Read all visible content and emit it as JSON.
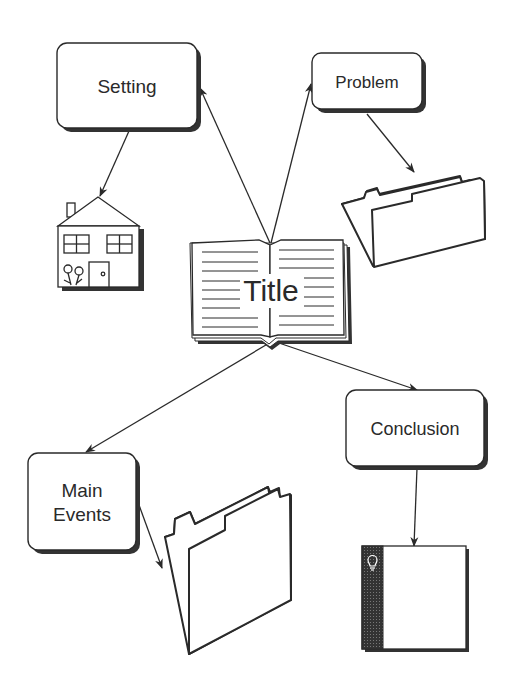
{
  "diagram": {
    "type": "story-map",
    "center": {
      "label": "Title",
      "icon": "open-book-icon"
    },
    "nodes": [
      {
        "id": "setting",
        "label": "Setting",
        "icon": "house-icon"
      },
      {
        "id": "problem",
        "label": "Problem",
        "icon": "folder-icon"
      },
      {
        "id": "main_events",
        "label_line1": "Main",
        "label_line2": "Events",
        "icon": "folder-icon"
      },
      {
        "id": "conclusion",
        "label": "Conclusion",
        "icon": "lightbulb-book-icon"
      }
    ],
    "edges": [
      {
        "from": "Title",
        "to": "Setting"
      },
      {
        "from": "Title",
        "to": "Problem"
      },
      {
        "from": "Title",
        "to": "Main Events"
      },
      {
        "from": "Title",
        "to": "Conclusion"
      },
      {
        "from": "Setting",
        "to": "house-icon"
      },
      {
        "from": "Problem",
        "to": "folder-icon"
      },
      {
        "from": "Main Events",
        "to": "folder-icon"
      },
      {
        "from": "Conclusion",
        "to": "lightbulb-book-icon"
      }
    ]
  },
  "colors": {
    "ink": "#2a2a2a",
    "background": "#ffffff",
    "shadow": "#333333"
  }
}
